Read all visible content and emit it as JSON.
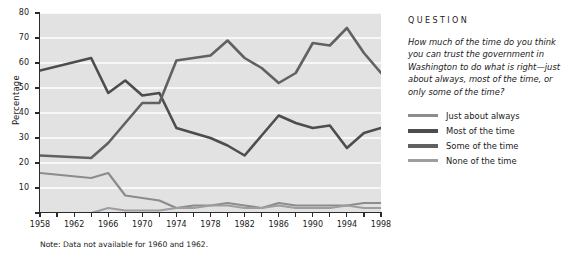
{
  "chart_data": {
    "type": "line",
    "title": "",
    "xlabel": "",
    "ylabel": "Percentage",
    "ylim": [
      0,
      80
    ],
    "yticks": [
      0,
      10,
      20,
      30,
      40,
      50,
      60,
      70,
      80
    ],
    "ytick_labels": [
      "",
      "10",
      "20",
      "30",
      "40",
      "50",
      "60",
      "70",
      "80"
    ],
    "xlim": [
      1958,
      1998
    ],
    "x": [
      1958,
      1964,
      1966,
      1968,
      1970,
      1972,
      1974,
      1976,
      1978,
      1980,
      1982,
      1984,
      1986,
      1988,
      1990,
      1992,
      1994,
      1996,
      1998
    ],
    "xticks": [
      1958,
      1960,
      1962,
      1964,
      1966,
      1968,
      1970,
      1972,
      1974,
      1976,
      1978,
      1980,
      1982,
      1984,
      1986,
      1988,
      1990,
      1992,
      1994,
      1996,
      1998
    ],
    "xtick_labels": [
      "1958",
      "",
      "",
      "1962",
      "",
      "1966",
      "",
      "1970",
      "",
      "1974",
      "",
      "1978",
      "",
      "1982",
      "",
      "1986",
      "",
      "1990",
      "",
      "1994",
      "1998"
    ],
    "xtick_labeled": [
      1958,
      1962,
      1966,
      1970,
      1974,
      1978,
      1982,
      1986,
      1990,
      1994,
      1998
    ],
    "grid": "horizontal-white",
    "plot_background": "#e2e2e2",
    "legend_position": "right",
    "series": [
      {
        "name": "Just about always",
        "color": "#8c8c8c",
        "width": 2.2,
        "values": [
          16,
          14,
          16,
          7,
          6,
          5,
          2,
          3,
          3,
          4,
          3,
          2,
          4,
          3,
          3,
          3,
          3,
          4,
          4
        ]
      },
      {
        "name": "Most of the time",
        "color": "#4d4d4d",
        "width": 2.6,
        "values": [
          57,
          62,
          48,
          53,
          47,
          48,
          34,
          32,
          30,
          27,
          23,
          31,
          39,
          36,
          34,
          35,
          26,
          32,
          34
        ]
      },
      {
        "name": "Some of the time",
        "color": "#616161",
        "width": 2.6,
        "values": [
          23,
          22,
          28,
          36,
          44,
          44,
          61,
          62,
          63,
          69,
          62,
          58,
          52,
          56,
          68,
          67,
          74,
          64,
          56
        ]
      },
      {
        "name": "None of the time",
        "color": "#9e9e9e",
        "width": 2.2,
        "values": [
          0,
          0,
          2,
          1,
          1,
          1,
          2,
          2,
          3,
          3,
          2,
          2,
          3,
          2,
          2,
          2,
          3,
          2,
          2
        ]
      }
    ],
    "note": "Note:  Data not available for 1960 and 1962."
  },
  "panel": {
    "title": "QUESTION",
    "question": "How much of the time do you think you can trust the government in Washington to do what is right—just about always, most of the time, or only some of the time?",
    "legend": [
      {
        "label": "Just about always",
        "color": "#8c8c8c"
      },
      {
        "label": "Most of the time",
        "color": "#4d4d4d"
      },
      {
        "label": "Some of the time",
        "color": "#616161"
      },
      {
        "label": "None of the time",
        "color": "#9e9e9e"
      }
    ]
  }
}
